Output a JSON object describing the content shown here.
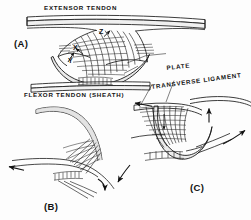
{
  "figure": {
    "background_color": "#fdfdfd",
    "ink_color": "#141414",
    "band_fill": "#fefefe",
    "band_shade": "#b9b9b9"
  },
  "labels": {
    "extensor_tendon": "EXTENSOR TENDON",
    "flexor_tendon": "FLEXOR TENDON (SHEATH)",
    "plate": "PLATE",
    "transverse_ligament": "TRANSVERSE LIGAMENT"
  },
  "panels": {
    "a": "(A)",
    "b": "(B)",
    "c": "(C)"
  },
  "vectors": {
    "x": "X",
    "y": "Y",
    "z": "Z"
  },
  "icons": {
    "arrow_left_b": "arrow-left-icon",
    "arrow_down_right_b": "arrow-down-right-icon",
    "arrow_left_c": "arrow-left-icon",
    "arrow_up_c": "arrow-up-icon",
    "arrow_up_right_c": "arrow-up-right-icon",
    "arrow_down_left_c": "arrow-down-left-icon",
    "arrow_x": "arrow-x-icon",
    "arrow_y": "arrow-y-icon",
    "arrow_z": "arrow-z-icon",
    "arrow_down_c_inner": "arrow-down-icon"
  }
}
